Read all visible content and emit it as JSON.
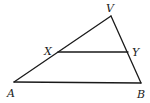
{
  "figure": {
    "type": "triangle-with-midsegment",
    "points": {
      "V": {
        "x": 111,
        "y": 16
      },
      "A": {
        "x": 14,
        "y": 82
      },
      "B": {
        "x": 141,
        "y": 83
      },
      "X": {
        "x": 58,
        "y": 52
      },
      "Y": {
        "x": 128,
        "y": 52
      }
    },
    "labels": {
      "V": "V",
      "X": "X",
      "Y": "Y",
      "A": "A",
      "B": "B"
    },
    "segments": [
      "AV",
      "VB",
      "AB",
      "XY"
    ],
    "line_color": "#1a1a1a"
  }
}
